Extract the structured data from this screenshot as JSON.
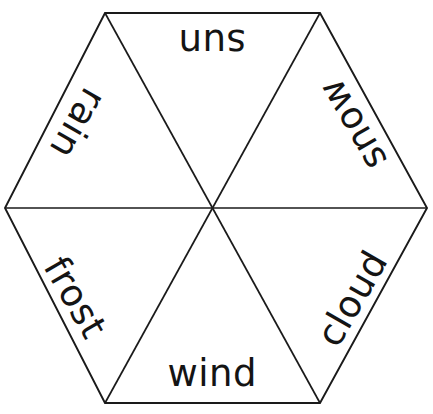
{
  "document": {
    "title": "Weather Word Wheel",
    "kind": "hexagon-word-wheel",
    "background_color": "#ffffff",
    "line_color": "#1a1a1a",
    "text_color": "#141414"
  },
  "wheel": {
    "shape": "hexagon",
    "sector_count": 6,
    "center": {
      "x": 212,
      "y": 208
    },
    "vertices": [
      {
        "name": "top-left",
        "x": 105,
        "y": 13
      },
      {
        "name": "top-right",
        "x": 320,
        "y": 13
      },
      {
        "name": "right",
        "x": 427,
        "y": 208
      },
      {
        "name": "bottom-right",
        "x": 320,
        "y": 403
      },
      {
        "name": "bottom-left",
        "x": 105,
        "y": 403
      },
      {
        "name": "left",
        "x": 5,
        "y": 208
      }
    ],
    "sectors": [
      {
        "id": "sun",
        "label": "sun",
        "position": "top",
        "rotation": 180,
        "cx": 212,
        "cy": 42,
        "font_size": 37
      },
      {
        "id": "snow",
        "label": "snow",
        "position": "upper-right",
        "rotation": 240,
        "cx": 353,
        "cy": 124,
        "font_size": 37
      },
      {
        "id": "cloud",
        "label": "cloud",
        "position": "lower-right",
        "rotation": 300,
        "cx": 352,
        "cy": 298,
        "font_size": 37
      },
      {
        "id": "wind",
        "label": "wind",
        "position": "bottom",
        "rotation": 0,
        "cx": 212,
        "cy": 373,
        "font_size": 37
      },
      {
        "id": "frost",
        "label": "frost",
        "position": "lower-left",
        "rotation": 60,
        "cx": 75,
        "cy": 297,
        "font_size": 37
      },
      {
        "id": "rain",
        "label": "rain",
        "position": "upper-left",
        "rotation": 120,
        "cx": 78,
        "cy": 123,
        "font_size": 37
      }
    ]
  }
}
